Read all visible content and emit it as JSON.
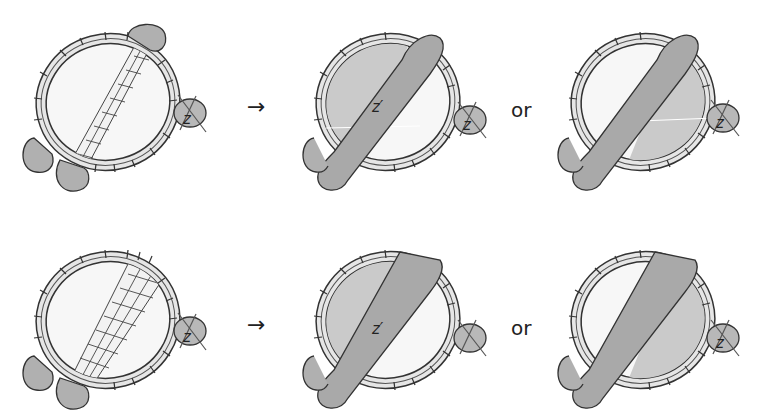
{
  "figure": {
    "rows": [
      {
        "before": {
          "curve_label": "z",
          "band": "grid-strip"
        },
        "arrow": "→",
        "after_option_1": {
          "curve_label": "z",
          "band_label": "z′",
          "shaded_side": "left"
        },
        "separator": "or",
        "after_option_2": {
          "curve_label": "z",
          "shaded_side": "right"
        }
      },
      {
        "before": {
          "curve_label": "z",
          "band": "grid-strip-wide"
        },
        "arrow": "→",
        "after_option_1": {
          "curve_label": "z",
          "band_label": "z′",
          "shaded_side": "left"
        },
        "separator": "or",
        "after_option_2": {
          "curve_label": "z",
          "shaded_side": "right"
        }
      }
    ],
    "labels": {
      "arrow": "→",
      "or": "or",
      "z": "z",
      "z_prime": "z′"
    },
    "colors": {
      "outline": "#333333",
      "shade_dark": "#a9a9a9",
      "shade_light": "#c8c8c8",
      "ring_fill": "#e6e6e6",
      "interior": "#f5f5f5"
    }
  }
}
